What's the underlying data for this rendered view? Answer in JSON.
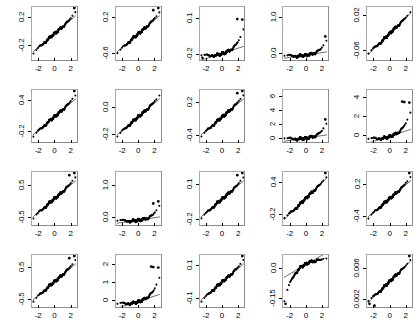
{
  "figure": {
    "title": "",
    "type": "qq-plot-grid",
    "rows": 4,
    "cols": 5,
    "point_color": "#000000",
    "line_color": "#1a1a1a",
    "box_color": "#8c8c8c",
    "background": "#ffffff"
  },
  "chart_data": {
    "type": "scatter",
    "title": "",
    "subtitle": "",
    "xlabel": "",
    "ylabel": "",
    "layout": {
      "rows": 4,
      "cols": 5,
      "grid": false,
      "legend": "none"
    },
    "shared_x": {
      "ticks": [
        -2,
        0,
        2
      ],
      "ticklabels": [
        "-2",
        "0",
        "2"
      ],
      "xlim": [
        -2.9,
        2.9
      ]
    },
    "panels": [
      {
        "row": 1,
        "col": 1,
        "yticks": [
          -0.2,
          0.2
        ],
        "yticklabels": [
          "-0.2",
          "0.2"
        ],
        "ylim": [
          -0.42,
          0.36
        ],
        "shape": "s-curve",
        "tail": "both",
        "outlier_high": 1,
        "outlier_low": 0,
        "spread": 1.0
      },
      {
        "row": 1,
        "col": 2,
        "yticks": [
          -0.6,
          0.2
        ],
        "yticklabels": [
          "-0.6",
          "0.2"
        ],
        "ylim": [
          -0.78,
          0.45
        ],
        "shape": "s-curve",
        "tail": "upper",
        "outlier_high": 2,
        "outlier_low": 0,
        "spread": 0.95
      },
      {
        "row": 1,
        "col": 3,
        "yticks": [
          -0.2,
          0.1
        ],
        "yticklabels": [
          "-0.2",
          "0.1"
        ],
        "ylim": [
          -0.25,
          0.2
        ],
        "shape": "convex",
        "tail": "upper",
        "outlier_high": 2,
        "outlier_low": 1,
        "spread": 0.62
      },
      {
        "row": 1,
        "col": 4,
        "yticks": [
          0.0,
          1.0
        ],
        "yticklabels": [
          "0.0",
          "1.0"
        ],
        "ylim": [
          -0.22,
          1.32
        ],
        "shape": "flat-skew",
        "tail": "upper",
        "outlier_high": 1,
        "outlier_low": 0,
        "spread": 0.35
      },
      {
        "row": 1,
        "col": 5,
        "yticks": [
          -0.06,
          0.02
        ],
        "yticklabels": [
          "-0.06",
          "0.02"
        ],
        "ylim": [
          -0.085,
          0.04
        ],
        "shape": "linear",
        "tail": "none",
        "outlier_high": 0,
        "outlier_low": 0,
        "spread": 1.0
      },
      {
        "row": 2,
        "col": 1,
        "yticks": [
          -0.2,
          0.4
        ],
        "yticklabels": [
          "-0.2",
          "0.4"
        ],
        "ylim": [
          -0.42,
          0.62
        ],
        "shape": "s-curve",
        "tail": "upper",
        "outlier_high": 1,
        "outlier_low": 0,
        "spread": 0.88
      },
      {
        "row": 2,
        "col": 2,
        "yticks": [
          -0.2,
          0.0
        ],
        "yticklabels": [
          "-0.2",
          "0.0"
        ],
        "ylim": [
          -0.27,
          0.14
        ],
        "shape": "s-curve",
        "tail": "none",
        "outlier_high": 0,
        "outlier_low": 0,
        "spread": 1.0
      },
      {
        "row": 2,
        "col": 3,
        "yticks": [
          -0.4,
          0.2
        ],
        "yticklabels": [
          "-0.4",
          "0.2"
        ],
        "ylim": [
          -0.55,
          0.45
        ],
        "shape": "s-curve",
        "tail": "upper",
        "outlier_high": 2,
        "outlier_low": 0,
        "spread": 0.9
      },
      {
        "row": 2,
        "col": 4,
        "yticks": [
          0,
          2,
          4,
          6
        ],
        "yticklabels": [
          "0",
          "2",
          "4",
          "6"
        ],
        "ylim": [
          -0.7,
          7.0
        ],
        "shape": "flat-skew",
        "tail": "upper",
        "outlier_high": 1,
        "outlier_low": 0,
        "spread": 0.18
      },
      {
        "row": 2,
        "col": 5,
        "yticks": [
          0,
          2,
          4
        ],
        "yticklabels": [
          "0",
          "2",
          "4"
        ],
        "ylim": [
          -0.85,
          4.9
        ],
        "shape": "convex",
        "tail": "upper",
        "outlier_high": 3,
        "outlier_low": 0,
        "spread": 0.3
      },
      {
        "row": 3,
        "col": 1,
        "yticks": [
          -0.5,
          0.5
        ],
        "yticklabels": [
          "-0.5",
          "0.5"
        ],
        "ylim": [
          -0.78,
          0.95
        ],
        "shape": "s-curve",
        "tail": "upper",
        "outlier_high": 2,
        "outlier_low": 0,
        "spread": 0.9
      },
      {
        "row": 3,
        "col": 2,
        "yticks": [
          0.0,
          1.0
        ],
        "yticklabels": [
          "0.0",
          "1.0"
        ],
        "ylim": [
          -0.28,
          1.45
        ],
        "shape": "flat-skew",
        "tail": "upper",
        "outlier_high": 2,
        "outlier_low": 0,
        "spread": 0.3
      },
      {
        "row": 3,
        "col": 3,
        "yticks": [
          -0.2,
          0.1
        ],
        "yticklabels": [
          "-0.2",
          "0.1"
        ],
        "ylim": [
          -0.26,
          0.21
        ],
        "shape": "s-curve",
        "tail": "upper",
        "outlier_high": 2,
        "outlier_low": 0,
        "spread": 0.95
      },
      {
        "row": 3,
        "col": 4,
        "yticks": [
          -0.2,
          0.4
        ],
        "yticklabels": [
          "-0.2",
          "0.4"
        ],
        "ylim": [
          -0.42,
          0.6
        ],
        "shape": "linear",
        "tail": "none",
        "outlier_high": 1,
        "outlier_low": 0,
        "spread": 1.0
      },
      {
        "row": 3,
        "col": 5,
        "yticks": [
          -0.4,
          0.2
        ],
        "yticklabels": [
          "-0.4",
          "0.2"
        ],
        "ylim": [
          -0.58,
          0.45
        ],
        "shape": "s-curve",
        "tail": "upper",
        "outlier_high": 1,
        "outlier_low": 0,
        "spread": 0.95
      },
      {
        "row": 4,
        "col": 1,
        "yticks": [
          -0.5,
          0.5
        ],
        "yticklabels": [
          "-0.5",
          "0.5"
        ],
        "ylim": [
          -0.78,
          0.92
        ],
        "shape": "s-curve",
        "tail": "upper",
        "outlier_high": 2,
        "outlier_low": 0,
        "spread": 0.92
      },
      {
        "row": 4,
        "col": 2,
        "yticks": [
          0,
          1,
          2
        ],
        "yticklabels": [
          "0",
          "1",
          "2"
        ],
        "ylim": [
          -0.45,
          2.6
        ],
        "shape": "convex",
        "tail": "upper",
        "outlier_high": 3,
        "outlier_low": 0,
        "spread": 0.28
      },
      {
        "row": 4,
        "col": 3,
        "yticks": [
          -0.1,
          0.1
        ],
        "yticklabels": [
          "-0.1",
          "0.1"
        ],
        "ylim": [
          -0.16,
          0.17
        ],
        "shape": "s-curve",
        "tail": "upper",
        "outlier_high": 1,
        "outlier_low": 0,
        "spread": 0.98
      },
      {
        "row": 4,
        "col": 4,
        "yticks": [
          -0.15,
          0.0
        ],
        "yticklabels": [
          "-0.15",
          "0.0"
        ],
        "ylim": [
          -0.2,
          0.07
        ],
        "shape": "concave",
        "tail": "lower",
        "outlier_high": 0,
        "outlier_low": 1,
        "spread": 0.85
      },
      {
        "row": 4,
        "col": 5,
        "yticks": [
          0.002,
          0.006
        ],
        "yticklabels": [
          "0.002",
          "0.006"
        ],
        "ylim": [
          0.0008,
          0.0078
        ],
        "shape": "linear",
        "tail": "both",
        "outlier_high": 1,
        "outlier_low": 2,
        "spread": 1.0
      }
    ]
  }
}
